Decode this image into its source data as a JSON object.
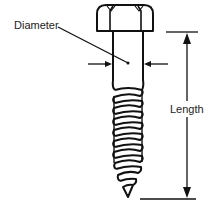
{
  "diagram": {
    "labels": {
      "diameter": "Diameter",
      "length": "Length"
    },
    "colors": {
      "line": "#111111",
      "background": "#ffffff",
      "text": "#222222"
    }
  }
}
